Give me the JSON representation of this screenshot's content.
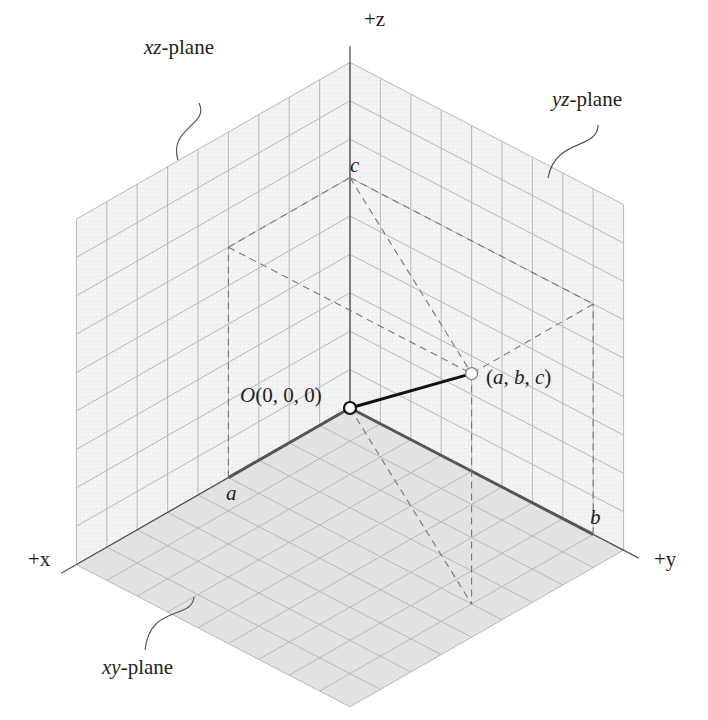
{
  "diagram": {
    "axes": {
      "x_label": "+x",
      "y_label": "+y",
      "z_label": "+z"
    },
    "planes": [
      {
        "id": "xz",
        "italic": "xz",
        "suffix": "-plane"
      },
      {
        "id": "yz",
        "italic": "yz",
        "suffix": "-plane"
      },
      {
        "id": "xy",
        "italic": "xy",
        "suffix": "-plane"
      }
    ],
    "grid_units": 9,
    "point": {
      "a": 4,
      "b": 8,
      "c": 6,
      "label": "(a, b, c)",
      "label_parts": [
        "(",
        "a",
        ", ",
        "b",
        ", ",
        "c",
        ")"
      ]
    },
    "origin": {
      "label_italic": "O",
      "label_rest": "(0, 0, 0)"
    },
    "coordinate_labels": {
      "a": "a",
      "b": "b",
      "c": "c"
    },
    "colors": {
      "wall_fill": "#f4f4f4",
      "floor_fill": "#e2e2e2",
      "grid_line": "#b8b8b8",
      "minor_grid": "#e6e6e6",
      "axis": "#555555",
      "dashed": "#777777",
      "vector": "#111111",
      "text": "#231f20"
    }
  }
}
